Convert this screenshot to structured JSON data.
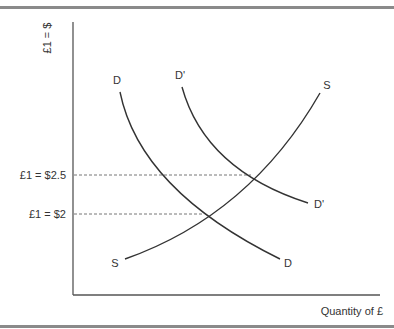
{
  "figure": {
    "y_axis_label": "£1 = $",
    "x_axis_label": "Quantity of £",
    "price_levels": [
      {
        "label": "£1 = $2.5",
        "value": 2.5
      },
      {
        "label": "£1 = $2",
        "value": 2
      }
    ],
    "curves": {
      "demand": {
        "start_label": "D",
        "end_label": "D"
      },
      "demand_shifted": {
        "start_label": "D'",
        "end_label": "D'"
      },
      "supply": {
        "start_label": "S",
        "end_label": "S"
      }
    },
    "colors": {
      "curve": "#333333",
      "guide": "#777777",
      "rule": "#8a8a8a"
    }
  }
}
